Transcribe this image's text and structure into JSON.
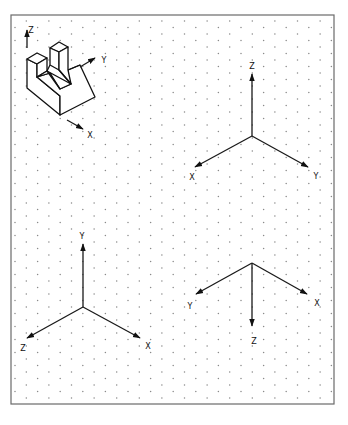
{
  "sheet": {
    "border": {
      "x": 11,
      "y": 15,
      "width": 323,
      "height": 389,
      "color": "#6a6a6a"
    },
    "grid": {
      "type": "isometric-dot",
      "x0": 15,
      "y0": 21,
      "dx": 11.3,
      "dy": 13,
      "dot_color": "#8a8a8a"
    }
  },
  "part_view": {
    "title": "isometric part with slot",
    "axes": [
      {
        "label": "Z",
        "from": [
          27,
          48
        ],
        "to": [
          27,
          30
        ],
        "label_pos": [
          31,
          30
        ]
      },
      {
        "label": "Y",
        "from": [
          80,
          67
        ],
        "to": [
          95,
          58
        ],
        "label_pos": [
          104,
          60
        ]
      },
      {
        "label": "X",
        "from": [
          67,
          120
        ],
        "to": [
          83,
          129
        ],
        "label_pos": [
          90,
          135
        ]
      }
    ]
  },
  "axis_sets": [
    {
      "name": "z-up",
      "origin": [
        252,
        136
      ],
      "axes": [
        {
          "label": "Z",
          "to": [
            252,
            74
          ],
          "label_pos": [
            252,
            66
          ]
        },
        {
          "label": "X",
          "to": [
            195,
            167
          ],
          "label_pos": [
            192,
            177
          ]
        },
        {
          "label": "Y",
          "to": [
            308,
            167
          ],
          "label_pos": [
            316,
            176
          ]
        }
      ]
    },
    {
      "name": "y-up",
      "origin": [
        83,
        307
      ],
      "axes": [
        {
          "label": "Y",
          "to": [
            83,
            244
          ],
          "label_pos": [
            82,
            236
          ]
        },
        {
          "label": "Z",
          "to": [
            27,
            338
          ],
          "label_pos": [
            23,
            348
          ]
        },
        {
          "label": "X",
          "to": [
            140,
            338
          ],
          "label_pos": [
            148,
            346
          ]
        }
      ]
    },
    {
      "name": "z-down",
      "origin": [
        252,
        263
      ],
      "axes": [
        {
          "label": "Y",
          "to": [
            196,
            294
          ],
          "label_pos": [
            190,
            306
          ]
        },
        {
          "label": "X",
          "to": [
            307,
            294
          ],
          "label_pos": [
            317,
            303
          ]
        },
        {
          "label": "Z",
          "to": [
            252,
            326
          ],
          "label_pos": [
            254,
            341
          ]
        }
      ]
    }
  ]
}
